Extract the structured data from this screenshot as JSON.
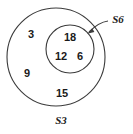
{
  "diagram": {
    "type": "nested-set-venn-diagram",
    "background_color": "#ffffff",
    "stroke_color": "#3b3b3b",
    "text_color": "#1a1a1a",
    "outer_set": {
      "label": "S3",
      "label_position": "below-circle",
      "center_x": 56,
      "center_y": 57,
      "radius": 49,
      "members_outside_inner": [
        {
          "value": "3",
          "x": 31,
          "y": 35
        },
        {
          "value": "9",
          "x": 27,
          "y": 74
        },
        {
          "value": "15",
          "x": 62,
          "y": 94
        }
      ]
    },
    "inner_set": {
      "label": "S6",
      "label_position": "upper-right-with-leader",
      "center_x": 70,
      "center_y": 49,
      "radius": 24,
      "members": [
        {
          "value": "18",
          "x": 70,
          "y": 38
        },
        {
          "value": "12",
          "x": 61,
          "y": 57
        },
        {
          "value": "6",
          "x": 80,
          "y": 57
        }
      ]
    },
    "leader": {
      "label_x": 118,
      "label_y": 20,
      "line_start_x": 108,
      "line_start_y": 21,
      "arrow_tip_x": 88,
      "arrow_tip_y": 33
    }
  }
}
